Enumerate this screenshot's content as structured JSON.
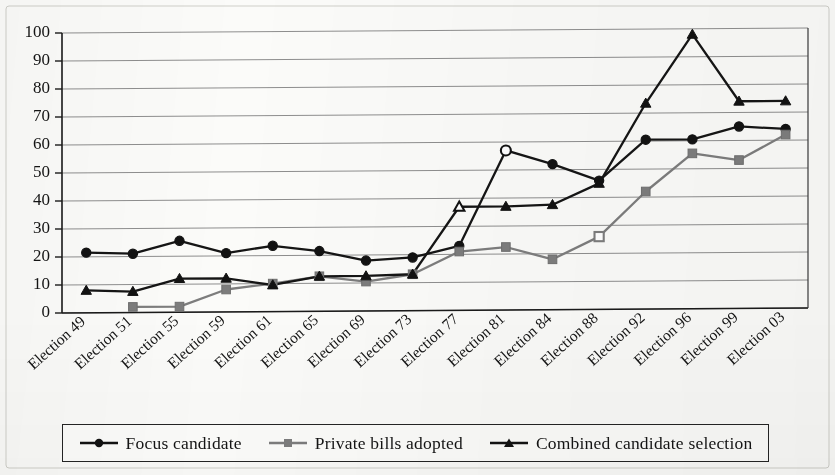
{
  "chart_data": {
    "type": "line",
    "title": "",
    "subtitle": "",
    "xlabel": "",
    "ylabel": "",
    "ylim": [
      0,
      100
    ],
    "ytick_step": 10,
    "yticks": [
      "0",
      "10",
      "20",
      "30",
      "40",
      "50",
      "60",
      "70",
      "80",
      "90",
      "100"
    ],
    "grid": true,
    "legend_position": "bottom",
    "categories": [
      "Election 49",
      "Election 51",
      "Election 55",
      "Election 59",
      "Election 61",
      "Election 65",
      "Election 69",
      "Election 73",
      "Election 77",
      "Election 81",
      "Election 84",
      "Election 88",
      "Election 92",
      "Election 96",
      "Election 99",
      "Election 03"
    ],
    "series": [
      {
        "name": "Focus candidate",
        "color": "#121212",
        "marker": "circle",
        "values": [
          21.5,
          21.0,
          25.5,
          21.0,
          23.5,
          21.5,
          18.0,
          19.0,
          23.0,
          57.0,
          52.0,
          46.0,
          60.5,
          60.5,
          65.0,
          64.0
        ],
        "hollow_points": [
          9
        ]
      },
      {
        "name": "Private bills adopted",
        "color": "#7d7d7d",
        "marker": "square",
        "values": [
          null,
          2.0,
          2.0,
          8.0,
          10.0,
          12.5,
          10.5,
          13.0,
          21.0,
          22.5,
          18.0,
          26.0,
          42.0,
          55.5,
          53.0,
          62.0
        ],
        "hollow_points": [
          11
        ]
      },
      {
        "name": "Combined candidate selection",
        "color": "#121212",
        "marker": "triangle",
        "values": [
          8.0,
          7.5,
          12.0,
          12.0,
          9.5,
          12.5,
          12.5,
          13.0,
          37.0,
          37.0,
          37.5,
          45.0,
          73.5,
          98.0,
          74.0,
          74.0
        ],
        "hollow_points": [
          8
        ]
      }
    ]
  },
  "legend": {
    "items": [
      {
        "label": "Focus candidate",
        "marker": "circle",
        "color": "#121212"
      },
      {
        "label": "Private bills adopted",
        "marker": "square",
        "color": "#7d7d7d"
      },
      {
        "label": "Combined candidate selection",
        "marker": "triangle",
        "color": "#121212"
      }
    ]
  }
}
